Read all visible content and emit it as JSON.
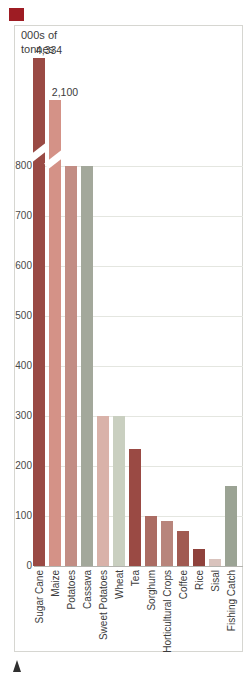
{
  "page": {
    "accent_square_color": "#9e1c23"
  },
  "chart_data": {
    "type": "bar",
    "ylabel": "000s of tonnes",
    "categories": [
      "Sugar Cane",
      "Maize",
      "Potatoes",
      "Cassava",
      "Sweet Potatoes",
      "Wheat",
      "Tea",
      "Sorghum",
      "Horticultural Crops",
      "Coffee",
      "Rice",
      "Sisal",
      "Fishing Catch"
    ],
    "values": [
      4334,
      2100,
      800,
      800,
      300,
      300,
      235,
      100,
      90,
      70,
      35,
      15,
      160
    ],
    "bar_colors": [
      "#9a4a44",
      "#d49287",
      "#c28d84",
      "#a3a89b",
      "#d9b2a9",
      "#c9cfc0",
      "#9a4a44",
      "#ab6c63",
      "#b8857c",
      "#a15a51",
      "#8f423c",
      "#d9c3bd",
      "#9ba394"
    ],
    "value_labels": [
      "4,334",
      "2,100"
    ],
    "y_ticks": [
      0,
      100,
      200,
      300,
      400,
      500,
      600,
      700,
      800
    ],
    "ylim": [
      0,
      800
    ],
    "axis_break": true,
    "grid": "horizontal",
    "legend": "none"
  }
}
